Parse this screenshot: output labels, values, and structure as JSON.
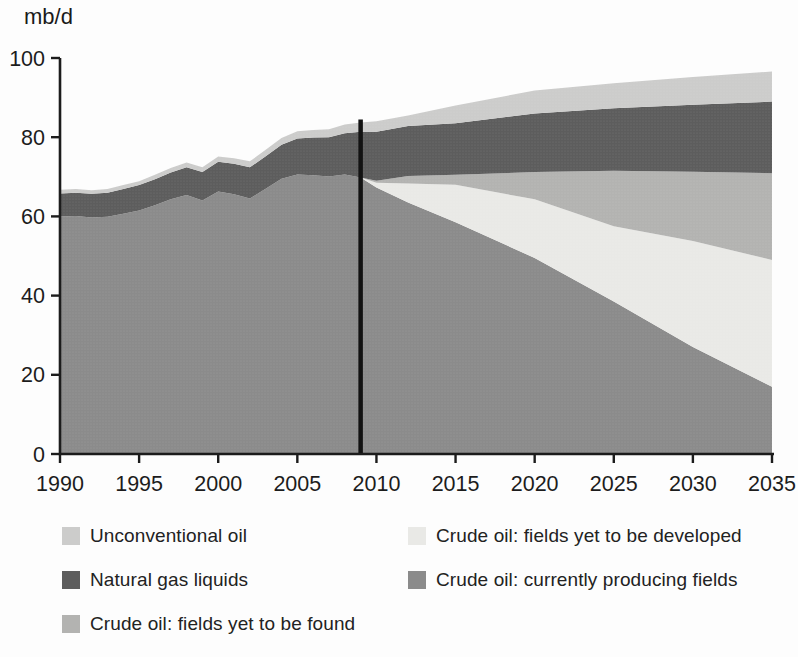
{
  "figure": {
    "unit_label": "mb/d"
  },
  "colors": {
    "producing": "#8b8b8b",
    "ytbd": "#e9e9e6",
    "ytbf": "#b3b3b1",
    "ngl": "#5d5d5d",
    "unconventional": "#cccccb",
    "axis": "#1c1c1c",
    "divider": "#121212",
    "text": "#1c1c1c",
    "background": "#fdfdfd"
  },
  "chart_data": {
    "type": "area",
    "stacked": true,
    "title": "",
    "ylabel": "mb/d",
    "xlabel": "",
    "ylim": [
      0,
      100
    ],
    "yticks": [
      0,
      20,
      40,
      60,
      80,
      100
    ],
    "xticks": [
      1990,
      1995,
      2000,
      2005,
      2010,
      2015,
      2020,
      2025,
      2030,
      2035
    ],
    "grid": false,
    "legend_position": "bottom",
    "divider_x": 2009,
    "x": [
      1990,
      1991,
      1992,
      1993,
      1994,
      1995,
      1996,
      1997,
      1998,
      1999,
      2000,
      2001,
      2002,
      2003,
      2004,
      2005,
      2006,
      2007,
      2008,
      2009,
      2010,
      2012,
      2015,
      2020,
      2025,
      2030,
      2035
    ],
    "series": [
      {
        "key": "producing",
        "name": "Crude oil: currently producing fields",
        "values": [
          60.0,
          60.1,
          59.7,
          59.9,
          60.7,
          61.5,
          62.8,
          64.3,
          65.4,
          64.0,
          66.3,
          65.6,
          64.5,
          67.0,
          69.5,
          70.6,
          70.4,
          70.1,
          70.6,
          69.8,
          67.3,
          63.5,
          58.5,
          49.5,
          38.5,
          27.0,
          17.0
        ]
      },
      {
        "key": "ytbd",
        "name": "Crude oil: fields yet to be developed",
        "values": [
          0,
          0,
          0,
          0,
          0,
          0,
          0,
          0,
          0,
          0,
          0,
          0,
          0,
          0,
          0,
          0,
          0,
          0,
          0,
          0,
          1.2,
          4.8,
          9.5,
          14.8,
          19.0,
          26.8,
          32.0
        ]
      },
      {
        "key": "ytbf",
        "name": "Crude oil: fields yet to be found",
        "values": [
          0,
          0,
          0,
          0,
          0,
          0,
          0,
          0,
          0,
          0,
          0,
          0,
          0,
          0,
          0,
          0,
          0,
          0,
          0,
          0,
          0.5,
          1.9,
          2.5,
          6.9,
          14.0,
          17.5,
          21.9
        ]
      },
      {
        "key": "ngl",
        "name": "Natural gas liquids",
        "values": [
          5.8,
          5.9,
          6.0,
          6.1,
          6.2,
          6.4,
          6.6,
          6.8,
          7.0,
          7.2,
          7.5,
          7.7,
          7.9,
          8.2,
          8.6,
          9.1,
          9.5,
          9.9,
          10.4,
          11.6,
          12.4,
          12.6,
          13.0,
          14.8,
          15.8,
          16.9,
          18.1
        ]
      },
      {
        "key": "unconventional",
        "name": "Unconventional oil",
        "values": [
          0.9,
          0.9,
          0.9,
          0.9,
          1.0,
          1.0,
          1.1,
          1.1,
          1.2,
          1.2,
          1.3,
          1.4,
          1.5,
          1.6,
          1.7,
          1.8,
          1.9,
          2.0,
          2.2,
          2.3,
          2.6,
          2.7,
          4.5,
          5.8,
          6.3,
          7.0,
          7.6
        ]
      }
    ]
  },
  "legend": {
    "items": [
      {
        "key": "unconventional",
        "label": "Unconventional oil"
      },
      {
        "key": "ytbd",
        "label": "Crude oil: fields yet to be developed"
      },
      {
        "key": "ngl",
        "label": "Natural gas liquids"
      },
      {
        "key": "producing",
        "label": "Crude oil: currently producing fields"
      },
      {
        "key": "ytbf",
        "label": "Crude oil: fields yet to be found"
      }
    ]
  }
}
